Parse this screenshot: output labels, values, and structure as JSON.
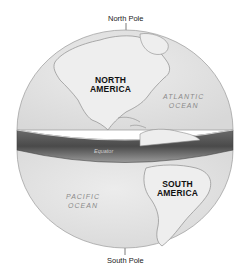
{
  "diagram": {
    "title_fragment": "y",
    "poles": {
      "north": "North Pole",
      "south": "South Pole"
    },
    "continents": [
      {
        "line1": "NORTH",
        "line2": "AMERICA"
      },
      {
        "line1": "SOUTH",
        "line2": "AMERICA"
      }
    ],
    "oceans": [
      {
        "line1": "ATLANTIC",
        "line2": "OCEAN"
      },
      {
        "line1": "PACIFIC",
        "line2": "OCEAN"
      }
    ],
    "equator_label": "Equator",
    "colors": {
      "globe": "#e4e4e4",
      "land": "#ededed",
      "outline": "#9a9a9a",
      "band_dark": "#555555",
      "band_light": "#b5b5b5"
    }
  }
}
